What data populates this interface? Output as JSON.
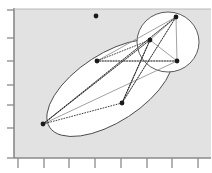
{
  "figure": {
    "title": "",
    "background_color": "#ffffff",
    "plot_area_color": "#e2e2e2",
    "ellipse_fill": "#ffffff",
    "axis_color": "#8a8a8a",
    "point_color": "#1a1a1a",
    "edge_color": "#8a8a8a",
    "dotted_edge_color": "#2b2b2b"
  },
  "chart_data": {
    "type": "scatter",
    "title": "",
    "xlabel": "",
    "ylabel": "",
    "grid": false,
    "legend": "none",
    "xlim": [
      0,
      8
    ],
    "ylim": [
      0,
      7
    ],
    "x_tick_labels": [
      "",
      "",
      "",
      "",
      "",
      "",
      "",
      ""
    ],
    "y_tick_labels": [
      "",
      "",
      "",
      "",
      "",
      "",
      ""
    ],
    "x_ticks_px": [
      18,
      44,
      69,
      95,
      121,
      147,
      172,
      198
    ],
    "y_ticks_px": [
      10,
      38,
      61,
      85,
      105,
      128,
      158
    ],
    "plot_box_px": {
      "left": 14,
      "top": 9,
      "right": 211,
      "bottom": 158
    },
    "points": [
      {
        "id": "p0",
        "label": "",
        "x_px": 96,
        "y_px": 16,
        "cluster": "none"
      },
      {
        "id": "p1",
        "label": "",
        "x_px": 176,
        "y_px": 17,
        "cluster": "circle"
      },
      {
        "id": "p2",
        "label": "",
        "x_px": 150,
        "y_px": 40,
        "cluster": "circle"
      },
      {
        "id": "p3",
        "label": "",
        "x_px": 177,
        "y_px": 61,
        "cluster": "circle"
      },
      {
        "id": "p4",
        "label": "",
        "x_px": 97,
        "y_px": 61,
        "cluster": "ellipse"
      },
      {
        "id": "p5",
        "label": "",
        "x_px": 122,
        "y_px": 103,
        "cluster": "ellipse"
      },
      {
        "id": "p6",
        "label": "",
        "x_px": 43,
        "y_px": 124,
        "cluster": "ellipse"
      }
    ],
    "clusters": [
      {
        "id": "ellipse",
        "name": "large-tilted-ellipse",
        "cx": 110,
        "cy": 88,
        "rx": 72,
        "ry": 34,
        "rotation_deg": -33
      },
      {
        "id": "circle",
        "name": "upper-right-circle",
        "cx": 168,
        "cy": 42,
        "rx": 31,
        "ry": 30,
        "rotation_deg": 0
      }
    ],
    "edges_solid": [
      {
        "from": "p6",
        "to": "p1"
      },
      {
        "from": "p6",
        "to": "p2"
      },
      {
        "from": "p6",
        "to": "p3"
      },
      {
        "from": "p4",
        "to": "p1"
      },
      {
        "from": "p4",
        "to": "p3"
      },
      {
        "from": "p5",
        "to": "p1"
      },
      {
        "from": "p5",
        "to": "p2"
      },
      {
        "from": "p2",
        "to": "p1"
      },
      {
        "from": "p3",
        "to": "p1"
      },
      {
        "from": "p3",
        "to": "p2"
      }
    ],
    "edges_dotted": [
      {
        "from": "p6",
        "to": "p1"
      },
      {
        "from": "p6",
        "to": "p2"
      },
      {
        "from": "p4",
        "to": "p3"
      },
      {
        "from": "p4",
        "to": "p2"
      },
      {
        "from": "p5",
        "to": "p2"
      },
      {
        "from": "p5",
        "to": "p1"
      },
      {
        "from": "p6",
        "to": "p5"
      },
      {
        "from": "p2",
        "to": "p5"
      }
    ]
  }
}
